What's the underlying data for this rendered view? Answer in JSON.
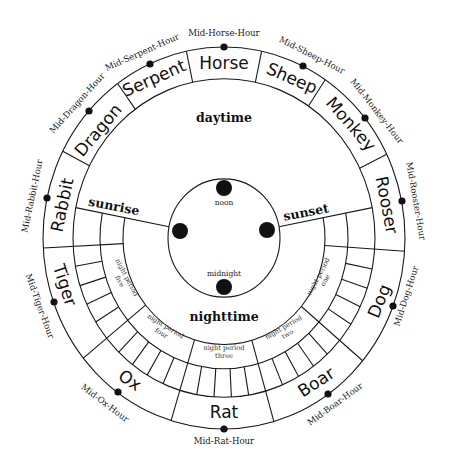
{
  "diagram": {
    "center_labels": {
      "daytime": "daytime",
      "nighttime": "nighttime",
      "sunrise": "sunrise",
      "sunset": "sunset",
      "noon": "noon",
      "midnight": "midnight"
    },
    "zodiac_hours": [
      {
        "name": "Horse",
        "mid_label": "Mid-Horse-Hour"
      },
      {
        "name": "Sheep",
        "mid_label": "Mid-Sheep-Hour"
      },
      {
        "name": "Monkey",
        "mid_label": "Mid-Monkey-Hour"
      },
      {
        "name": "Rooser",
        "mid_label": "Mid-Rooster-Hour"
      },
      {
        "name": "Dog",
        "mid_label": "Mid-Dog-Hour"
      },
      {
        "name": "Boar",
        "mid_label": "Mid-Boar-Hour"
      },
      {
        "name": "Rat",
        "mid_label": "Mid-Rat-Hour"
      },
      {
        "name": "Ox",
        "mid_label": "Mid-Ox-Hour"
      },
      {
        "name": "Tiger",
        "mid_label": "Mid-Tiger-Hour"
      },
      {
        "name": "Rabbit",
        "mid_label": "Mid-Rabbit-Hour"
      },
      {
        "name": "Dragon",
        "mid_label": "Mid-Dragon-Hour"
      },
      {
        "name": "Serpent",
        "mid_label": "Mid-Serpent-Hour"
      }
    ],
    "night_periods": [
      {
        "line1": "night period",
        "line2": "one"
      },
      {
        "line1": "night period",
        "line2": "two"
      },
      {
        "line1": "night period",
        "line2": "three"
      },
      {
        "line1": "night period",
        "line2": "four"
      },
      {
        "line1": "night period",
        "line2": "five"
      }
    ],
    "geometry": {
      "zodiac_boundaries_deg": [
        348,
        12,
        34,
        64,
        94,
        130,
        164,
        197,
        231,
        267,
        297,
        324
      ],
      "sunrise_deg": 281,
      "sunset_deg": 79,
      "night_sector_boundaries_deg": [
        94,
        130,
        164,
        197,
        231,
        267
      ],
      "cells_per_night_hour": 5,
      "radii": {
        "outer": 181,
        "zodiac_inner": 151,
        "cell_inner": 124,
        "night_inner": 101,
        "core": 56
      }
    },
    "colors": {
      "ink": "#1a1a1a",
      "background": "#ffffff"
    }
  }
}
